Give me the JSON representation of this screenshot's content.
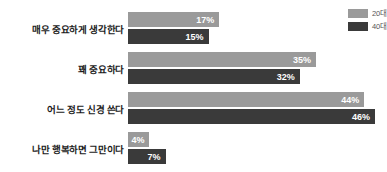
{
  "chart_data": {
    "type": "bar",
    "orientation": "horizontal",
    "title": "",
    "xlabel": "",
    "ylabel": "",
    "grid": false,
    "legend_position": "top-right",
    "xlim": [
      0,
      46
    ],
    "value_suffix": "%",
    "categories": [
      "매우 중요하게 생각한다",
      "꽤 중요하다",
      "어느 정도 신경 쓴다",
      "나만 행복하면 그만이다"
    ],
    "series": [
      {
        "name": "20대",
        "color": "#9a9a9a",
        "values": [
          17,
          35,
          44,
          4
        ],
        "labels": [
          "17%",
          "35%",
          "44%",
          "4%"
        ]
      },
      {
        "name": "40대",
        "color": "#3a3a3a",
        "values": [
          15,
          32,
          46,
          7
        ],
        "labels": [
          "15%",
          "32%",
          "46%",
          "7%"
        ]
      }
    ]
  },
  "legend": {
    "items": [
      {
        "label": "20대",
        "color": "#9a9a9a"
      },
      {
        "label": "40대",
        "color": "#3a3a3a"
      }
    ]
  }
}
